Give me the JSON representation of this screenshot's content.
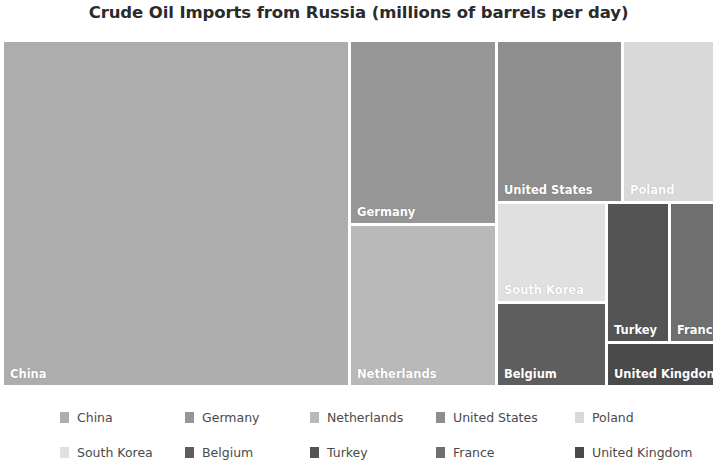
{
  "chart_data": {
    "type": "treemap",
    "title": "Crude Oil Imports from Russia (millions of barrels per day)",
    "xlabel": "",
    "ylabel": "",
    "legend_position": "bottom",
    "grid": false,
    "categories": [
      "China",
      "Germany",
      "Netherlands",
      "United States",
      "Poland",
      "South Korea",
      "Belgium",
      "Turkey",
      "France",
      "United Kingdom"
    ],
    "values": [
      1.6,
      0.55,
      0.48,
      0.42,
      0.3,
      0.23,
      0.2,
      0.17,
      0.13,
      0.12
    ],
    "tiles": [
      {
        "label": "China",
        "value": 1.6,
        "color": "#adadad",
        "x": 0,
        "y": 0,
        "w": 344,
        "h": 343
      },
      {
        "label": "Germany",
        "value": 0.55,
        "color": "#969696",
        "x": 347,
        "y": 0,
        "w": 144,
        "h": 181
      },
      {
        "label": "Netherlands",
        "value": 0.48,
        "color": "#b9b9b9",
        "x": 347,
        "y": 184,
        "w": 144,
        "h": 159
      },
      {
        "label": "United States",
        "value": 0.42,
        "color": "#8e8e8e",
        "x": 494,
        "y": 0,
        "w": 123,
        "h": 159
      },
      {
        "label": "Poland",
        "value": 0.3,
        "color": "#d9d9d9",
        "x": 620,
        "y": 0,
        "w": 89,
        "h": 159
      },
      {
        "label": "South Korea",
        "value": 0.23,
        "color": "#e0e0e0",
        "x": 494,
        "y": 162,
        "w": 107,
        "h": 97
      },
      {
        "label": "Belgium",
        "value": 0.2,
        "color": "#5e5e5e",
        "x": 494,
        "y": 262,
        "w": 107,
        "h": 81
      },
      {
        "label": "Turkey",
        "value": 0.17,
        "color": "#545454",
        "x": 604,
        "y": 162,
        "w": 60,
        "h": 137
      },
      {
        "label": "France",
        "value": 0.13,
        "color": "#6f6f6f",
        "x": 667,
        "y": 162,
        "w": 42,
        "h": 137
      },
      {
        "label": "United Kingdom",
        "value": 0.12,
        "color": "#4a4a4a",
        "x": 604,
        "y": 302,
        "w": 105,
        "h": 41
      }
    ]
  },
  "legend": {
    "rows": [
      [
        {
          "label": "China",
          "color": "#adadad",
          "x": 60
        },
        {
          "label": "Germany",
          "color": "#969696",
          "x": 185
        },
        {
          "label": "Netherlands",
          "color": "#b9b9b9",
          "x": 310
        },
        {
          "label": "United States",
          "color": "#8e8e8e",
          "x": 436
        },
        {
          "label": "Poland",
          "color": "#d9d9d9",
          "x": 575
        }
      ],
      [
        {
          "label": "South Korea",
          "color": "#e0e0e0",
          "x": 60
        },
        {
          "label": "Belgium",
          "color": "#5e5e5e",
          "x": 185
        },
        {
          "label": "Turkey",
          "color": "#545454",
          "x": 310
        },
        {
          "label": "France",
          "color": "#6f6f6f",
          "x": 436
        },
        {
          "label": "United Kingdom",
          "color": "#4a4a4a",
          "x": 575
        }
      ]
    ]
  }
}
